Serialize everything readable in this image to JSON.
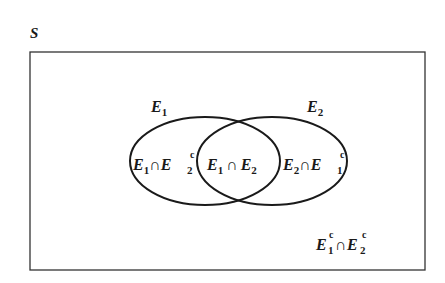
{
  "diagram": {
    "type": "venn",
    "universe_label": "S",
    "sets": [
      {
        "name": "E1",
        "label_main": "E",
        "label_sub": "1"
      },
      {
        "name": "E2",
        "label_main": "E",
        "label_sub": "2"
      }
    ],
    "regions": {
      "left_only": {
        "a": "E",
        "a_sub": "1",
        "op": "∩",
        "b": "E",
        "b_sub": "2",
        "b_sup": "c"
      },
      "intersection": {
        "a": "E",
        "a_sub": "1",
        "op": "∩",
        "b": "E",
        "b_sub": "2"
      },
      "right_only": {
        "a": "E",
        "a_sub": "2",
        "op": "∩",
        "b": "E",
        "b_sub": "1",
        "b_sup": "c"
      },
      "outside": {
        "a": "E",
        "a_sub": "1",
        "a_sup": "c",
        "op": "∩",
        "b": "E",
        "b_sub": "2",
        "b_sup": "c"
      }
    },
    "colors": {
      "stroke": "#1a1a1a",
      "background": "#ffffff"
    }
  }
}
